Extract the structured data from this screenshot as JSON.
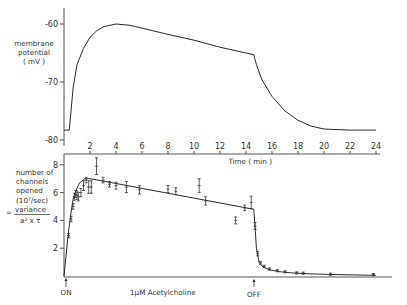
{
  "chart_data": [
    {
      "type": "line",
      "title": "",
      "ylabel": "membrane potential (mV)",
      "xlabel": "",
      "xlim": [
        0,
        24
      ],
      "ylim": [
        -80,
        -58
      ],
      "yticks": [
        -60,
        -70,
        -80
      ],
      "ytick_labels": [
        "-60",
        "-70",
        "-80"
      ],
      "series": [
        {
          "name": "membrane potential",
          "x": [
            0.0,
            0.4,
            0.5,
            0.7,
            1.0,
            1.5,
            2.0,
            2.5,
            3.0,
            4.0,
            5.0,
            6.0,
            8.0,
            10.0,
            12.0,
            14.0,
            14.6,
            14.8,
            15.2,
            16.0,
            17.0,
            18.0,
            19.0,
            20.0,
            21.0,
            22.0,
            24.0
          ],
          "y": [
            -78.3,
            -78.3,
            -76,
            -71,
            -67,
            -64.2,
            -62.3,
            -61.2,
            -60.5,
            -60.0,
            -60.2,
            -60.7,
            -61.8,
            -62.8,
            -64.0,
            -65.0,
            -65.3,
            -67,
            -69.5,
            -72.5,
            -75.0,
            -76.6,
            -77.6,
            -78.1,
            -78.2,
            -78.3,
            -78.3
          ]
        }
      ]
    },
    {
      "type": "scatter",
      "title": "",
      "ylabel": "number of channels opened (10^7/sec) = variance / (a² x τ)",
      "ylabel_lines": [
        "number of",
        "channels",
        "opened",
        "(10⁷/sec)"
      ],
      "ylabel_formula": {
        "prefix": "=",
        "numerator": "variance",
        "denominator": "a² x τ"
      },
      "xlabel": "Time (min)",
      "xlim": [
        0,
        24
      ],
      "ylim": [
        0,
        8.5
      ],
      "xticks": [
        2,
        4,
        6,
        8,
        10,
        12,
        14,
        16,
        18,
        20,
        22,
        24
      ],
      "yticks": [
        2,
        4,
        6,
        8
      ],
      "fit_line": {
        "x": [
          0.0,
          0.3,
          0.5,
          0.7,
          0.9,
          1.2,
          1.6,
          2.0,
          2.6,
          14.6,
          14.7,
          14.8,
          15.0,
          15.3,
          15.8,
          16.5,
          17.5,
          19.0,
          21.0,
          24.0
        ],
        "y": [
          0.0,
          2.8,
          4.3,
          5.5,
          6.1,
          6.7,
          7.0,
          7.0,
          6.9,
          4.8,
          3.5,
          2.0,
          1.0,
          0.65,
          0.45,
          0.32,
          0.22,
          0.15,
          0.1,
          0.05
        ]
      },
      "points": [
        {
          "x": 0.35,
          "y": 2.9,
          "err": 0.15
        },
        {
          "x": 0.55,
          "y": 4.1,
          "err": 0.2
        },
        {
          "x": 0.7,
          "y": 5.0,
          "err": 0.2
        },
        {
          "x": 0.8,
          "y": 5.7,
          "err": 0.25
        },
        {
          "x": 0.9,
          "y": 5.9,
          "err": 0.25
        },
        {
          "x": 1.0,
          "y": 5.8,
          "err": 0.3
        },
        {
          "x": 1.1,
          "y": 5.7,
          "err": 0.3
        },
        {
          "x": 1.3,
          "y": 6.0,
          "err": 0.3
        },
        {
          "x": 1.5,
          "y": 6.5,
          "err": 0.35
        },
        {
          "x": 1.7,
          "y": 6.9,
          "err": 0.2
        },
        {
          "x": 1.9,
          "y": 6.4,
          "err": 0.45
        },
        {
          "x": 2.1,
          "y": 6.4,
          "err": 0.45
        },
        {
          "x": 2.5,
          "y": 7.9,
          "err": 0.6
        },
        {
          "x": 3.0,
          "y": 6.9,
          "err": 0.2
        },
        {
          "x": 3.5,
          "y": 6.6,
          "err": 0.2
        },
        {
          "x": 4.0,
          "y": 6.5,
          "err": 0.25
        },
        {
          "x": 4.8,
          "y": 6.4,
          "err": 0.4
        },
        {
          "x": 5.8,
          "y": 6.2,
          "err": 0.3
        },
        {
          "x": 8.0,
          "y": 6.25,
          "err": 0.25
        },
        {
          "x": 8.6,
          "y": 6.1,
          "err": 0.25
        },
        {
          "x": 10.4,
          "y": 6.5,
          "err": 0.5
        },
        {
          "x": 10.9,
          "y": 5.4,
          "err": 0.3
        },
        {
          "x": 13.2,
          "y": 4.0,
          "err": 0.25
        },
        {
          "x": 13.9,
          "y": 4.9,
          "err": 0.2
        },
        {
          "x": 14.4,
          "y": 5.3,
          "err": 0.45
        },
        {
          "x": 14.7,
          "y": 3.6,
          "err": 0.25
        },
        {
          "x": 14.9,
          "y": 1.6,
          "err": 0.15
        },
        {
          "x": 15.1,
          "y": 0.95,
          "err": 0.1
        },
        {
          "x": 15.4,
          "y": 0.7,
          "err": 0.08
        },
        {
          "x": 15.8,
          "y": 0.5,
          "err": 0.08
        },
        {
          "x": 16.4,
          "y": 0.38,
          "err": 0.08
        },
        {
          "x": 17.0,
          "y": 0.3,
          "err": 0.08
        },
        {
          "x": 17.9,
          "y": 0.22,
          "err": 0.08
        },
        {
          "x": 18.4,
          "y": 0.2,
          "err": 0.08
        },
        {
          "x": 20.5,
          "y": 0.13,
          "err": 0.08
        },
        {
          "x": 23.8,
          "y": 0.1,
          "err": 0.08
        }
      ],
      "annotations": [
        {
          "text": "ON",
          "x": 0.2
        },
        {
          "text": "1µM Acetylcholine",
          "x": 6.5
        },
        {
          "text": "OFF",
          "x": 14.6
        }
      ]
    }
  ],
  "labels": {
    "upper_ylabel_1": "membrane",
    "upper_ylabel_2": "potential",
    "upper_ylabel_3": "( mV )",
    "lower_ylabel_1": "number of",
    "lower_ylabel_2": "channels",
    "lower_ylabel_3": "opened",
    "lower_ylabel_4": "(10⁷/sec)",
    "formula_eq": "=",
    "formula_num": "variance",
    "formula_den": "a² x τ",
    "xlabel": "Time  ( min )",
    "on": "ON",
    "off": "OFF",
    "drug": "1µM Acetylcholine"
  }
}
